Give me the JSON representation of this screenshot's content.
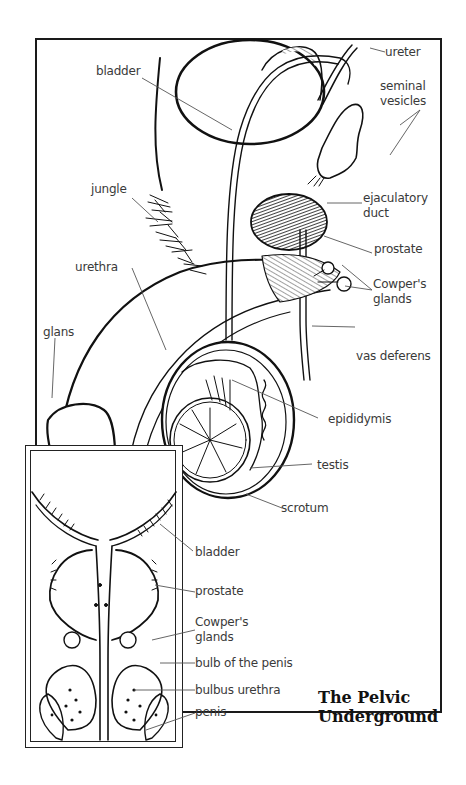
{
  "figure": {
    "title_line1": "The Pelvic",
    "title_line2": "Underground",
    "colors": {
      "ink": "#111111",
      "label": "#3a3a3a",
      "leader": "#555555",
      "background": "#ffffff"
    }
  },
  "main_labels": {
    "ureter": "ureter",
    "bladder": "bladder",
    "seminal_vesicles_1": "seminal",
    "seminal_vesicles_2": "vesicles",
    "jungle": "jungle",
    "ejaculatory_duct_1": "ejaculatory",
    "ejaculatory_duct_2": "duct",
    "prostate": "prostate",
    "cowpers_glands_1": "Cowper's",
    "cowpers_glands_2": "glands",
    "urethra": "urethra",
    "glans": "glans",
    "vas_deferens": "vas deferens",
    "epididymis": "epididymis",
    "testis": "testis",
    "scrotum": "scrotum"
  },
  "inset_labels": {
    "bladder": "bladder",
    "prostate": "prostate",
    "cowpers_glands_1": "Cowper's",
    "cowpers_glands_2": "glands",
    "bulb_of_the_penis": "bulb of the penis",
    "bulbus_urethra": "bulbus urethra",
    "penis": "penis"
  }
}
